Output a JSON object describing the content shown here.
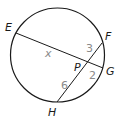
{
  "diagram": {
    "type": "intersecting-chords",
    "colors": {
      "stroke": "#1a1a1a",
      "point_label": "#1a1a1a",
      "segment_label": "#8a8a8a",
      "background": "#ffffff"
    },
    "circle": {
      "cx": 57.5,
      "cy": 55,
      "r": 47
    },
    "points": {
      "E": {
        "label": "E",
        "x": 16,
        "y": 33
      },
      "F": {
        "label": "F",
        "x": 102,
        "y": 43
      },
      "G": {
        "label": "G",
        "x": 103,
        "y": 68
      },
      "H": {
        "label": "H",
        "x": 57,
        "y": 102
      },
      "P": {
        "label": "P",
        "x": 87,
        "y": 62
      }
    },
    "chords": [
      {
        "name": "EG",
        "from": "E",
        "to": "G"
      },
      {
        "name": "FH",
        "from": "F",
        "to": "H"
      }
    ],
    "segment_labels": {
      "EP": "x",
      "PF": "3",
      "PG": "2",
      "PH": "6"
    }
  }
}
